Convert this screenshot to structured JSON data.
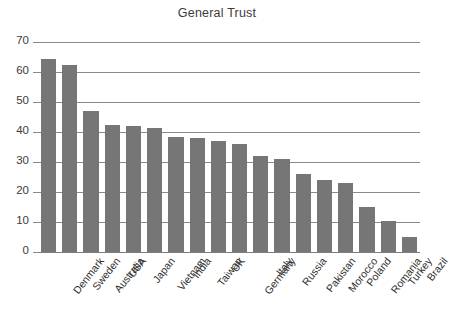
{
  "chart_data": {
    "type": "bar",
    "title": "General Trust",
    "xlabel": "",
    "ylabel": "",
    "ylim": [
      0,
      70
    ],
    "ytick_step": 10,
    "yticks": [
      70,
      60,
      50,
      40,
      30,
      20,
      10,
      0
    ],
    "grid": true,
    "legend": null,
    "bar_color": "#767676",
    "gridline_color": "#8a8a8a",
    "background_color": "#ffffff",
    "categories": [
      "Denmark",
      "Sweden",
      "Australia",
      "USA",
      "Japan",
      "Vietnam",
      "India",
      "Taiwan",
      "UK",
      "Germany",
      "Italy",
      "Russia",
      "Pakistan",
      "Morocco",
      "Poland",
      "Romania",
      "Turkey",
      "Brazil"
    ],
    "values": [
      64.5,
      62.5,
      47,
      42.5,
      42,
      41.5,
      38.5,
      38,
      37,
      36,
      32,
      31,
      26,
      24,
      23,
      15,
      10.5,
      5
    ]
  }
}
